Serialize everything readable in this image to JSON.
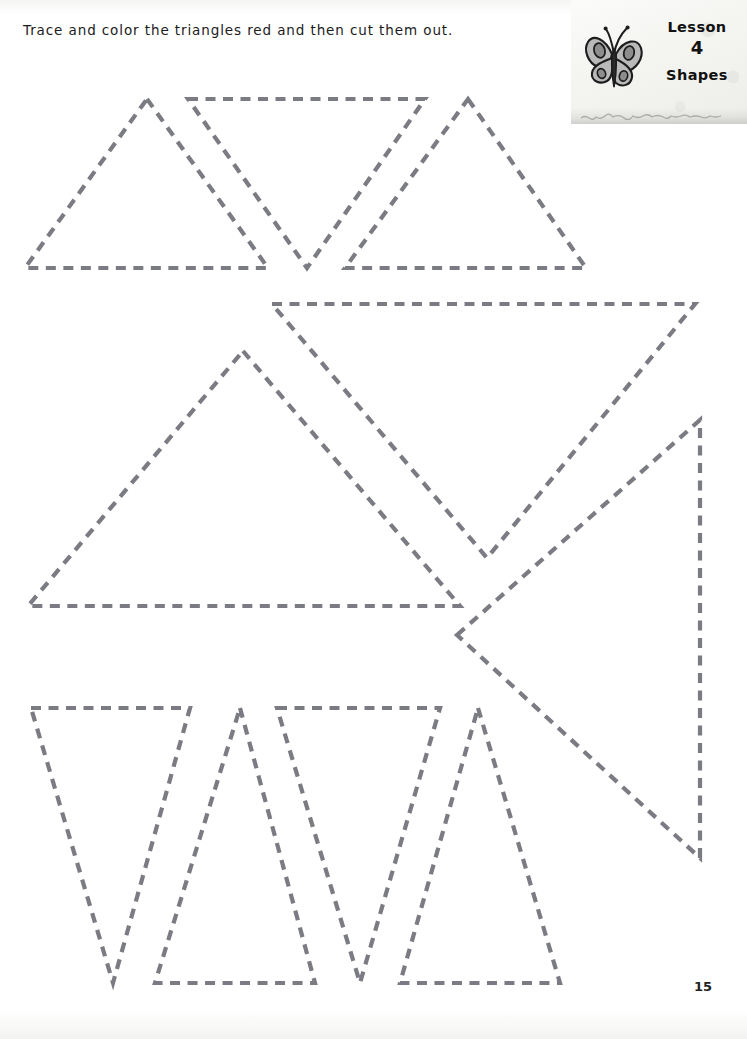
{
  "worksheet": {
    "instruction": "Trace and color the triangles red and then cut them out.",
    "page_number": "15",
    "stroke_color": "#7b7b83",
    "background_color": "#ffffff"
  },
  "lesson_header": {
    "lesson_label": "Lesson",
    "lesson_number": "4",
    "topic": "Shapes",
    "icon": "butterfly-icon",
    "panel_color": "#f4f4f1"
  },
  "chart_data": {
    "type": "diagram",
    "shape": "triangle",
    "units": "pixels",
    "canvas": [
      747,
      1039
    ],
    "rows": [
      {
        "name": "top-row",
        "shapes": [
          {
            "id": "triangle-1",
            "orientation": "up",
            "points": [
              [
                147,
                99
              ],
              [
                268,
                268
              ],
              [
                25,
                268
              ]
            ]
          },
          {
            "id": "triangle-2",
            "orientation": "down",
            "points": [
              [
                188,
                99
              ],
              [
                425,
                99
              ],
              [
                307,
                268
              ]
            ]
          },
          {
            "id": "triangle-3",
            "orientation": "up",
            "points": [
              [
                468,
                99
              ],
              [
                586,
                268
              ],
              [
                345,
                268
              ]
            ]
          }
        ]
      },
      {
        "name": "middle-row",
        "shapes": [
          {
            "id": "triangle-4",
            "orientation": "up",
            "points": [
              [
                243,
                351
              ],
              [
                460,
                606
              ],
              [
                28,
                606
              ]
            ]
          },
          {
            "id": "triangle-5",
            "orientation": "down",
            "points": [
              [
                272,
                304
              ],
              [
                695,
                304
              ],
              [
                487,
                558
              ]
            ]
          },
          {
            "id": "triangle-6",
            "orientation": "left",
            "points": [
              [
                457,
                635
              ],
              [
                700,
                420
              ],
              [
                700,
                858
              ]
            ]
          }
        ]
      },
      {
        "name": "bottom-row",
        "shapes": [
          {
            "id": "triangle-7",
            "orientation": "down",
            "points": [
              [
                31,
                708
              ],
              [
                190,
                708
              ],
              [
                113,
                983
              ]
            ]
          },
          {
            "id": "triangle-8",
            "orientation": "up",
            "points": [
              [
                240,
                708
              ],
              [
                315,
                983
              ],
              [
                155,
                983
              ]
            ]
          },
          {
            "id": "triangle-9",
            "orientation": "down",
            "points": [
              [
                277,
                708
              ],
              [
                440,
                708
              ],
              [
                360,
                983
              ]
            ]
          },
          {
            "id": "triangle-10",
            "orientation": "up",
            "points": [
              [
                478,
                708
              ],
              [
                560,
                983
              ],
              [
                400,
                983
              ]
            ]
          }
        ]
      }
    ],
    "shape_count": 10,
    "stroke_style": "dashed",
    "dash_length": 10,
    "dash_gap": 7.5,
    "stroke_width": 4.2
  }
}
